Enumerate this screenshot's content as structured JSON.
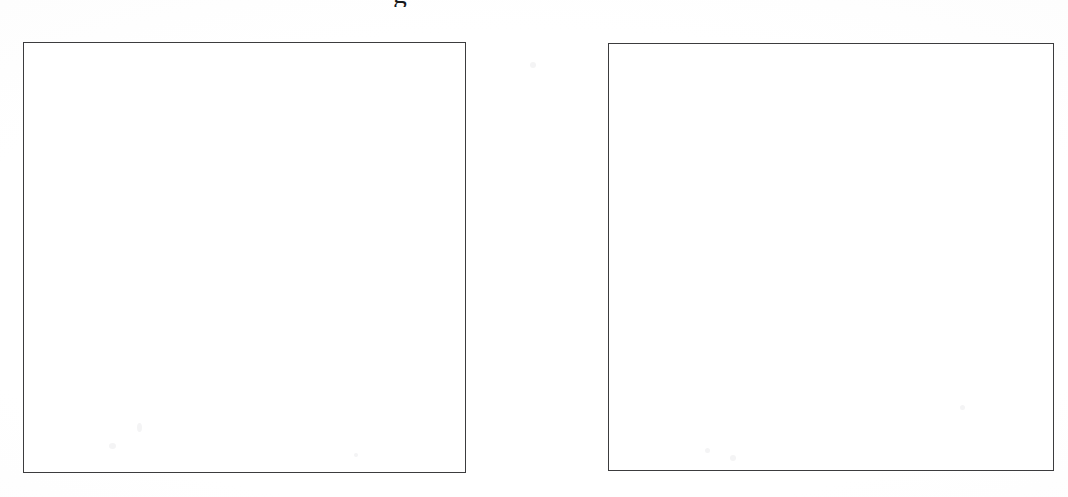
{
  "page": {
    "type": "scanned-document-page",
    "background_color": "#ffffff",
    "width": 1068,
    "height": 497
  },
  "caption_fragment": {
    "text": "g",
    "note": "descender of a caption line cropped off by the top edge of the scan",
    "color": "#17181a"
  },
  "figures": [
    {
      "id": "figure-left",
      "label": "",
      "content": "",
      "border_color": "#3c3c3e",
      "fill_color": "#ffffff",
      "x": 23,
      "y": 42,
      "width": 443,
      "height": 431
    },
    {
      "id": "figure-right",
      "label": "",
      "content": "",
      "border_color": "#3c3c3e",
      "fill_color": "#ffffff",
      "x": 608,
      "y": 43,
      "width": 446,
      "height": 428
    }
  ]
}
